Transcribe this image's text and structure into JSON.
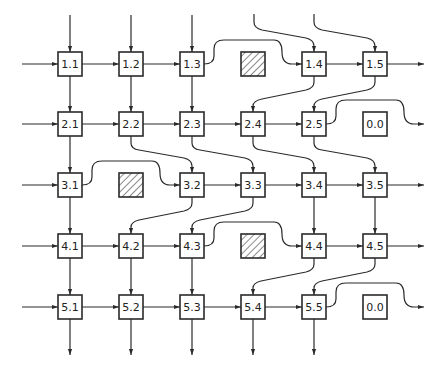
{
  "diagram": {
    "title": "",
    "grid": {
      "columns_x": [
        70,
        131,
        192,
        253,
        314,
        375
      ],
      "rows_y": [
        64,
        124,
        185,
        246,
        307
      ],
      "box_size": 24
    },
    "nodes": [
      {
        "id": "1.1",
        "label": "1.1",
        "col": 0,
        "row": 0
      },
      {
        "id": "1.2",
        "label": "1.2",
        "col": 1,
        "row": 0
      },
      {
        "id": "1.3",
        "label": "1.3",
        "col": 2,
        "row": 0
      },
      {
        "id": "1.4",
        "label": "1.4",
        "col": 4,
        "row": 0
      },
      {
        "id": "1.5",
        "label": "1.5",
        "col": 5,
        "row": 0
      },
      {
        "id": "2.1",
        "label": "2.1",
        "col": 0,
        "row": 1
      },
      {
        "id": "2.2",
        "label": "2.2",
        "col": 1,
        "row": 1
      },
      {
        "id": "2.3",
        "label": "2.3",
        "col": 2,
        "row": 1
      },
      {
        "id": "2.4",
        "label": "2.4",
        "col": 3,
        "row": 1
      },
      {
        "id": "2.5",
        "label": "2.5",
        "col": 4,
        "row": 1
      },
      {
        "id": "0.0a",
        "label": "0.0",
        "col": 5,
        "row": 1
      },
      {
        "id": "3.1",
        "label": "3.1",
        "col": 0,
        "row": 2
      },
      {
        "id": "3.2",
        "label": "3.2",
        "col": 2,
        "row": 2
      },
      {
        "id": "3.3",
        "label": "3.3",
        "col": 3,
        "row": 2
      },
      {
        "id": "3.4",
        "label": "3.4",
        "col": 4,
        "row": 2
      },
      {
        "id": "3.5",
        "label": "3.5",
        "col": 5,
        "row": 2
      },
      {
        "id": "4.1",
        "label": "4.1",
        "col": 0,
        "row": 3
      },
      {
        "id": "4.2",
        "label": "4.2",
        "col": 1,
        "row": 3
      },
      {
        "id": "4.3",
        "label": "4.3",
        "col": 2,
        "row": 3
      },
      {
        "id": "4.4",
        "label": "4.4",
        "col": 4,
        "row": 3
      },
      {
        "id": "4.5",
        "label": "4.5",
        "col": 5,
        "row": 3
      },
      {
        "id": "5.1",
        "label": "5.1",
        "col": 0,
        "row": 4
      },
      {
        "id": "5.2",
        "label": "5.2",
        "col": 1,
        "row": 4
      },
      {
        "id": "5.3",
        "label": "5.3",
        "col": 2,
        "row": 4
      },
      {
        "id": "5.4",
        "label": "5.4",
        "col": 3,
        "row": 4
      },
      {
        "id": "5.5",
        "label": "5.5",
        "col": 4,
        "row": 4
      },
      {
        "id": "0.0b",
        "label": "0.0",
        "col": 5,
        "row": 4
      }
    ],
    "blocked_cells": [
      {
        "col": 3,
        "row": 0
      },
      {
        "col": 1,
        "row": 2
      },
      {
        "col": 3,
        "row": 3
      }
    ],
    "edges": [
      "M70 15 L70 52",
      "M131 15 L131 52",
      "M192 15 L192 52",
      "M254 14 L254 22 Q254 28 262 30 L306 38 Q314 40 314 46 L314 52",
      "M314 14 L314 22 Q314 28 322 30 L367 38 Q375 40 375 46 L375 52",
      "M22 64 L58 64",
      "M82 64 L119 64",
      "M143 64 L180 64",
      "M204 64 Q214 64 214 56 L214 49 Q214 40 224 40 L274 40 Q282 40 282 52 Q282 64 292 64 L302 64",
      "M326 64 L363 64",
      "M387 64 L424 64",
      "M70 76 L70 112",
      "M131 76 L131 112",
      "M192 76 L192 112",
      "M314 76 L314 82 Q314 88 306 90 L262 99 Q253 101 253 106 L253 112",
      "M375 76 L375 82 Q375 88 367 90 L322 99 Q314 101 314 106 L314 112",
      "M22 124 L58 124",
      "M82 124 L119 124",
      "M143 124 L180 124",
      "M204 124 L241 124",
      "M265 124 L302 124",
      "M326 124 Q336 124 336 116 L336 109 Q336 100 346 100 L396 100 Q404 100 404 112 Q404 124 414 124 L424 124",
      "M70 136 L70 173",
      "M131 136 L131 143 Q131 149 139 150 L184 158 Q192 160 192 166 L192 173",
      "M192 136 L192 143 Q192 149 200 150 L245 158 Q253 160 253 166 L253 173",
      "M253 136 L253 143 Q253 149 261 150 L306 158 Q314 160 314 166 L314 173",
      "M314 136 L314 143 Q314 149 322 150 L367 158 Q375 160 375 166 L375 173",
      "M22 185 L58 185",
      "M82 185 Q92 185 92 177 L92 170 Q92 161 102 161 L152 161 Q160 161 160 173 Q160 185 170 185 L180 185",
      "M204 185 L241 185",
      "M265 185 L302 185",
      "M326 185 L363 185",
      "M387 185 L424 185",
      "M70 197 L70 234",
      "M192 197 L192 203 Q192 209 184 211 L139 220 Q131 222 131 227 L131 234",
      "M253 197 L253 203 Q253 209 245 211 L200 220 Q192 222 192 227 L192 234",
      "M314 197 L314 234",
      "M375 197 L375 234",
      "M22 246 L58 246",
      "M82 246 L119 246",
      "M143 246 L180 246",
      "M204 246 Q214 246 214 238 L214 231 Q214 222 224 222 L274 222 Q282 222 282 234 Q282 246 292 246 L302 246",
      "M326 246 L363 246",
      "M387 246 L424 246",
      "M70 258 L70 295",
      "M131 258 L131 295",
      "M192 258 L192 295",
      "M314 258 L314 264 Q314 270 306 272 L261 281 Q253 283 253 288 L253 295",
      "M375 258 L375 264 Q375 270 367 272 L322 281 Q314 283 314 288 L314 295",
      "M22 307 L58 307",
      "M82 307 L119 307",
      "M143 307 L180 307",
      "M204 307 L241 307",
      "M265 307 L302 307",
      "M326 307 Q336 307 336 299 L336 292 Q336 283 346 283 L396 283 Q404 283 404 295 Q404 307 414 307 L424 307",
      "M70 319 L70 355",
      "M131 319 L131 355",
      "M192 319 L192 355",
      "M253 319 L253 355",
      "M314 319 L314 355"
    ]
  }
}
